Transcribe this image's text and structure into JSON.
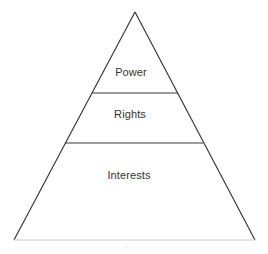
{
  "diagram": {
    "type": "pyramid",
    "tiers": [
      {
        "label": "Power",
        "position": "top"
      },
      {
        "label": "Rights",
        "position": "middle"
      },
      {
        "label": "Interests",
        "position": "bottom"
      }
    ],
    "colors": {
      "outline": "#3a3a3a",
      "base": "#c8c8c8",
      "text": "#333333",
      "background": "#ffffff"
    }
  }
}
